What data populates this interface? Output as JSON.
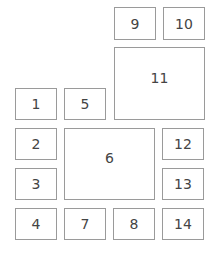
{
  "diagram": {
    "type": "numbered-layout-grid",
    "line_color": "#9a9a9a",
    "text_color": "#444444",
    "boxes": [
      {
        "label": "1",
        "x": 15,
        "y": 88,
        "w": 42,
        "h": 32
      },
      {
        "label": "2",
        "x": 15,
        "y": 128,
        "w": 42,
        "h": 32
      },
      {
        "label": "3",
        "x": 15,
        "y": 168,
        "w": 42,
        "h": 32
      },
      {
        "label": "4",
        "x": 15,
        "y": 208,
        "w": 42,
        "h": 32
      },
      {
        "label": "5",
        "x": 64,
        "y": 88,
        "w": 42,
        "h": 32
      },
      {
        "label": "6",
        "x": 64,
        "y": 128,
        "w": 91,
        "h": 72
      },
      {
        "label": "7",
        "x": 64,
        "y": 208,
        "w": 42,
        "h": 32
      },
      {
        "label": "8",
        "x": 113,
        "y": 208,
        "w": 42,
        "h": 32
      },
      {
        "label": "9",
        "x": 114,
        "y": 7,
        "w": 42,
        "h": 33
      },
      {
        "label": "10",
        "x": 163,
        "y": 7,
        "w": 42,
        "h": 33
      },
      {
        "label": "11",
        "x": 114,
        "y": 47,
        "w": 91,
        "h": 73
      },
      {
        "label": "12",
        "x": 162,
        "y": 128,
        "w": 42,
        "h": 32
      },
      {
        "label": "13",
        "x": 162,
        "y": 168,
        "w": 42,
        "h": 32
      },
      {
        "label": "14",
        "x": 162,
        "y": 208,
        "w": 42,
        "h": 32
      }
    ]
  }
}
